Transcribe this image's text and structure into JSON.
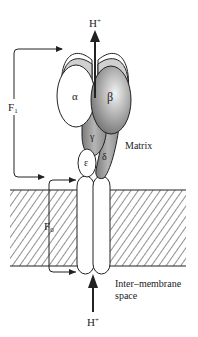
{
  "diagram": {
    "labels": {
      "proton_top": "H",
      "proton_top_charge": "+",
      "proton_bottom": "H",
      "proton_bottom_charge": "+",
      "alpha": "α",
      "beta": "β",
      "gamma": "γ",
      "delta": "δ",
      "epsilon": "ε",
      "f1": "F",
      "f1_sub": "1",
      "f0": "F",
      "f0_sub": "0",
      "matrix": "Matrix",
      "intermembrane_line1": "Inter–membrane",
      "intermembrane_line2": "space"
    },
    "colors": {
      "stroke": "#222222",
      "subunit_gray": "#9a9a9a",
      "cap_gray": "#d0d0d0",
      "white": "#ffffff"
    }
  }
}
